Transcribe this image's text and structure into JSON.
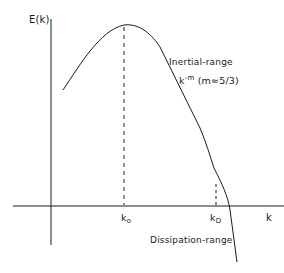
{
  "diagram": {
    "y_axis": {
      "label": "E(k)"
    },
    "x_axis": {
      "label": "k"
    },
    "markers": [
      {
        "id": "k0",
        "base": "k",
        "subscript": "o"
      },
      {
        "id": "kD",
        "base": "k",
        "subscript": "D"
      }
    ],
    "annotations": {
      "inertial_range": "Inertial-range",
      "power_law_base": "k",
      "power_law_exponent": "-m",
      "power_law_note": "(m≈5/3)",
      "dissipation_range": "Dissipation-range"
    },
    "colors": {
      "line": "#1a1a1a",
      "background": "#ffffff"
    }
  }
}
